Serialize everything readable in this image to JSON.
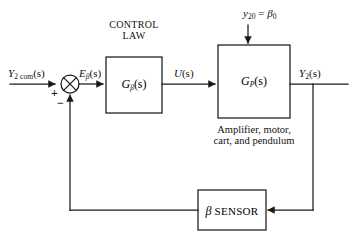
{
  "diagram": {
    "line_color": "#1a1a1a",
    "background": "#ffffff",
    "signals": {
      "reference": "Y2 com(s)",
      "reference_base": "Y",
      "reference_sub": "2 com",
      "reference_tail": "(s)",
      "error_base": "E",
      "error_sub": "β",
      "error_tail": "(s)",
      "control_base": "U",
      "control_tail": "(s)",
      "output_base": "Y",
      "output_sub": "2",
      "output_tail": "(s)",
      "disturbance_base": "y",
      "disturbance_sub": "20",
      "disturbance_eq": " = ",
      "disturbance_beta": "β",
      "disturbance_beta_sub": "0",
      "plus_sign": "+",
      "minus_sign": "−"
    },
    "blocks": {
      "controller_caption_line1": "CONTROL",
      "controller_caption_line2": "LAW",
      "controller_base": "G",
      "controller_sub": "β",
      "controller_tail": "(s)",
      "plant_base": "G",
      "plant_sub": "P",
      "plant_tail": "(s)",
      "plant_caption_line1": "Amplifier, motor,",
      "plant_caption_line2": "cart, and pendulum",
      "sensor_beta": "β",
      "sensor_label": " SENSOR"
    }
  }
}
